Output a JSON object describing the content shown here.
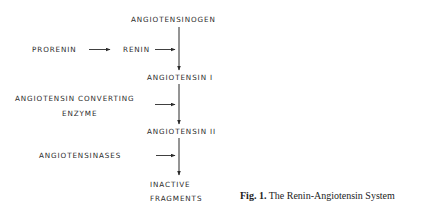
{
  "diagram": {
    "nodes": {
      "angiotensinogen": "ANGIOTENSINOGEN",
      "angiotensin_i": "ANGIOTENSIN  I",
      "angiotensin_ii": "ANGIOTENSIN  II",
      "inactive_line1": "INACTIVE",
      "inactive_line2": "FRAGMENTS"
    },
    "enzymes": {
      "prorenin": "PRORENIN",
      "renin": "RENIN",
      "ace_line1": "ANGIOTENSIN  CONVERTING",
      "ace_line2": "ENZYME",
      "angiotensinases": "ANGIOTENSINASES"
    },
    "edges": [
      {
        "from": "PRORENIN",
        "to": "RENIN",
        "type": "horizontal-arrow"
      },
      {
        "from": "RENIN",
        "to": "ANGIOTENSINOGEN→ANGIOTENSIN I",
        "type": "acts-on"
      },
      {
        "from": "ANGIOTENSINOGEN",
        "to": "ANGIOTENSIN I",
        "type": "vertical-arrow"
      },
      {
        "from": "ANGIOTENSIN CONVERTING ENZYME",
        "to": "ANGIOTENSIN I→ANGIOTENSIN II",
        "type": "acts-on"
      },
      {
        "from": "ANGIOTENSIN I",
        "to": "ANGIOTENSIN II",
        "type": "vertical-arrow"
      },
      {
        "from": "ANGIOTENSINASES",
        "to": "ANGIOTENSIN II→INACTIVE FRAGMENTS",
        "type": "acts-on"
      },
      {
        "from": "ANGIOTENSIN II",
        "to": "INACTIVE FRAGMENTS",
        "type": "vertical-arrow"
      }
    ],
    "colors": {
      "ink": "#2a2a2a",
      "background": "#ffffff"
    }
  },
  "caption": {
    "label": "Fig. 1.",
    "text": " The Renin-Angiotensin System"
  }
}
